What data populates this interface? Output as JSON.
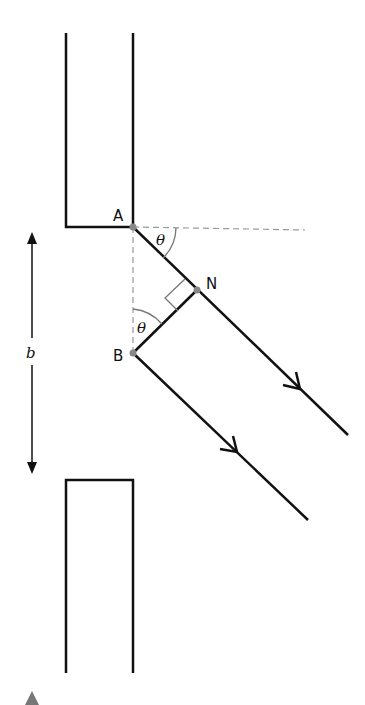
{
  "diagram": {
    "type": "single-slit diffraction geometry",
    "labels": {
      "point_a": "A",
      "point_b": "B",
      "point_n": "N",
      "theta_top": "θ",
      "theta_bottom": "θ",
      "slit_width": "b"
    },
    "colors": {
      "line": "#111111",
      "dashed": "#999999",
      "point": "#888888",
      "marker": "#777777"
    }
  }
}
